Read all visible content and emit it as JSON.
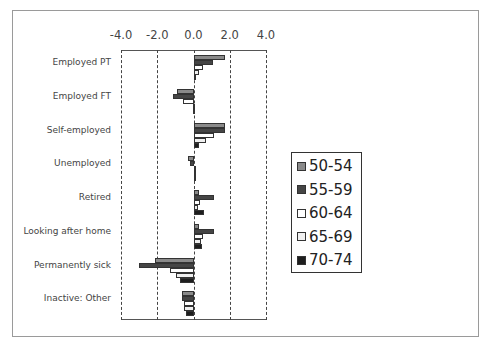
{
  "chart_data": {
    "type": "bar",
    "orientation": "horizontal",
    "title": "",
    "xlabel": "",
    "ylabel": "",
    "xlim": [
      -4.0,
      4.0
    ],
    "x_ticks": [
      "-4.0",
      "-2.0",
      "0.0",
      "2.0",
      "4.0"
    ],
    "x_tick_values": [
      -4,
      -2,
      0,
      2,
      4
    ],
    "grid": "vertical dashed at ticks",
    "legend_position": "right",
    "categories": [
      "Employed PT",
      "Employed FT",
      "Self-employed",
      "Unemployed",
      "Retired",
      "Looking after home",
      "Permanently sick",
      "Inactive: Other"
    ],
    "series": [
      {
        "name": "50-54",
        "color": "#8a8a8a",
        "values": [
          1.75,
          -0.9,
          1.75,
          -0.3,
          0.3,
          0.3,
          -2.15,
          -0.65
        ]
      },
      {
        "name": "55-59",
        "color": "#454545",
        "values": [
          1.05,
          -1.15,
          1.75,
          -0.2,
          1.15,
          1.15,
          -3.0,
          -0.65
        ]
      },
      {
        "name": "60-64",
        "color": "#ffffff",
        "values": [
          0.5,
          -0.6,
          1.15,
          0.0,
          0.35,
          0.5,
          -1.3,
          -0.55
        ]
      },
      {
        "name": "65-69",
        "color": "#f0f0f0",
        "values": [
          0.3,
          -0.05,
          0.7,
          0.0,
          0.25,
          0.4,
          -0.95,
          -0.5
        ]
      },
      {
        "name": "70-74",
        "color": "#1e1e1e",
        "values": [
          0.05,
          -0.05,
          0.3,
          0.0,
          0.6,
          0.45,
          -0.75,
          -0.4
        ]
      }
    ]
  }
}
